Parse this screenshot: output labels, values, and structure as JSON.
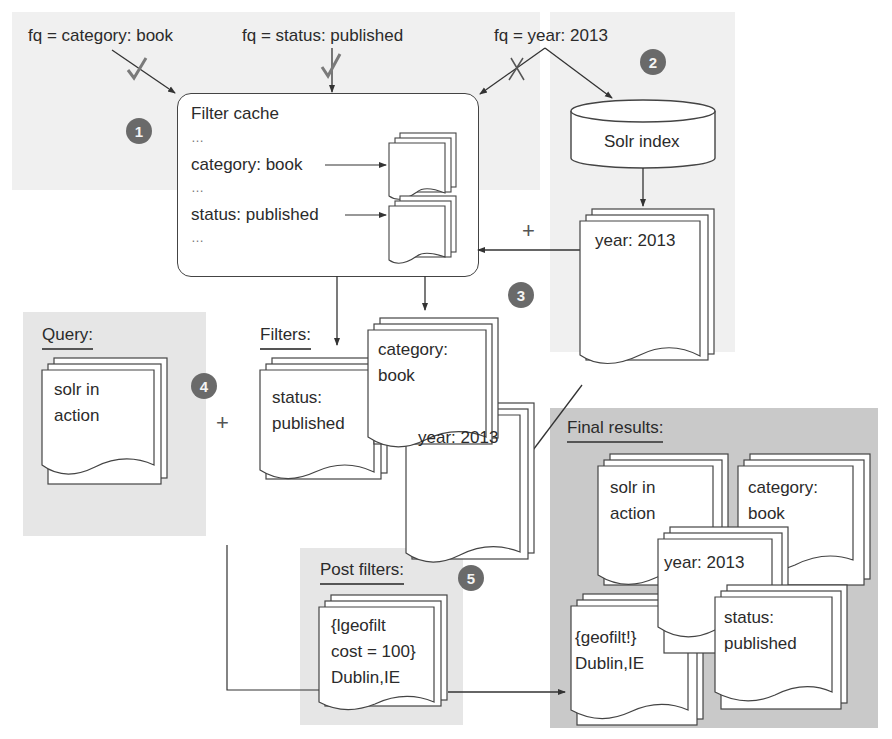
{
  "inputs": {
    "fq_category": "fq = category: book",
    "fq_status": "fq = status: published",
    "fq_year": "fq = year: 2013"
  },
  "steps": {
    "step1": "1",
    "step2": "2",
    "step3": "3",
    "step4": "4",
    "step5": "5"
  },
  "filter_cache": {
    "title": "Filter cache",
    "ellipsis": "…",
    "entry_category": "category: book",
    "entry_status": "status: published"
  },
  "solr_index": {
    "label": "Solr index",
    "result_doc": "year: 2013"
  },
  "operators": {
    "plus": "+"
  },
  "query": {
    "heading": "Query:",
    "doc": "solr in\naction"
  },
  "filters": {
    "heading": "Filters:",
    "docs": [
      "status:\npublished",
      "category:\nbook",
      "year: 2013"
    ]
  },
  "post_filters": {
    "heading": "Post filters:",
    "doc": "{lgeofilt\ncost = 100}\nDublin,IE"
  },
  "final_results": {
    "heading": "Final results:",
    "docs": [
      "solr in\naction",
      "category:\nbook",
      "year: 2013",
      "{geofilt!}\nDublin,IE",
      "status:\npublished"
    ]
  },
  "colors": {
    "badge": "#6a6a6a",
    "region_light": "#f0f0f0",
    "region_dark": "#c9c9c9",
    "line": "#444444",
    "check_mark": "#7a7a7a"
  }
}
